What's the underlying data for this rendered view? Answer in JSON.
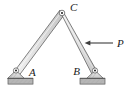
{
  "figure": {
    "type": "statics-free-body-diagram",
    "background_color": "#ffffff",
    "canvas": {
      "width": 131,
      "height": 96
    }
  },
  "colors": {
    "member_fill": "#d9d9d9",
    "member_fill_light": "#f0f0f0",
    "member_stroke": "#4d4d4d",
    "support_fill": "#dcdcdc",
    "support_stroke": "#555555",
    "ground_fill": "#b3b3b3",
    "ground_stroke": "#5a5a5a",
    "hatch_stroke": "#8c8c8c",
    "pin_fill": "#ffffff",
    "pin_center": "#1a1a1a",
    "arrow_color": "#3d3d3d",
    "label_color": "#1a1a1a"
  },
  "labels": {
    "apex": "C",
    "left_support": "A",
    "right_support": "B",
    "force": "P"
  },
  "geometry": {
    "joint_C": {
      "x": 62,
      "y": 13
    },
    "joint_A": {
      "x": 16,
      "y": 70
    },
    "joint_B": {
      "x": 95,
      "y": 70
    },
    "member_half_width": 3.0,
    "label_positions": {
      "C": {
        "x": 70,
        "y": 11
      },
      "A": {
        "x": 29,
        "y": 76
      },
      "B": {
        "x": 81,
        "y": 75
      },
      "P": {
        "x": 117,
        "y": 47
      }
    },
    "force_arrow": {
      "tail_x": 113,
      "tip_x": 85,
      "y": 43,
      "direction": "left"
    },
    "ground_left": {
      "x": 8,
      "y": 78,
      "width": 25,
      "height": 6
    },
    "ground_right": {
      "x": 80,
      "y": 78,
      "width": 25,
      "height": 6
    }
  },
  "members": [
    {
      "name": "member-AC",
      "from": "A",
      "to": "C"
    },
    {
      "name": "member-BC",
      "from": "B",
      "to": "C"
    }
  ]
}
